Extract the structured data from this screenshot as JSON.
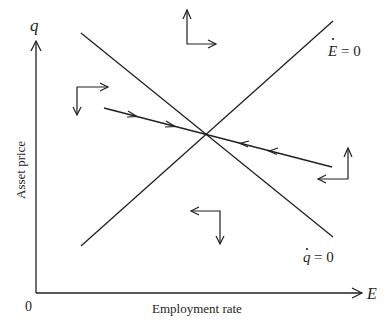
{
  "diagram": {
    "type": "phase-diagram",
    "y_axis": {
      "symbol": "q",
      "label": "Asset price"
    },
    "x_axis": {
      "symbol": "E",
      "label": "Employment rate"
    },
    "origin_label": "0",
    "loci": [
      {
        "id": "E-dot-zero",
        "symbol": "E",
        "equation": "= 0",
        "slope": "upward"
      },
      {
        "id": "q-dot-zero",
        "symbol": "q",
        "equation": "= 0",
        "slope": "downward"
      }
    ],
    "saddle_path": {
      "slope": "downward",
      "direction": "toward equilibrium"
    },
    "direction_arrows": [
      {
        "region": "top",
        "horizontal": "right",
        "vertical": "up"
      },
      {
        "region": "left",
        "horizontal": "right",
        "vertical": "down"
      },
      {
        "region": "right",
        "horizontal": "left",
        "vertical": "up"
      },
      {
        "region": "bottom",
        "horizontal": "left",
        "vertical": "down"
      }
    ],
    "color": "#231f20"
  }
}
